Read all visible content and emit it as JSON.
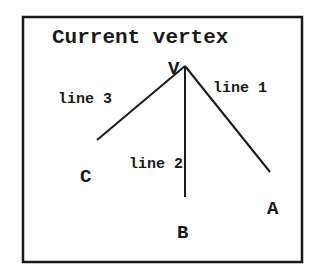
{
  "diagram": {
    "title": "Current vertex",
    "vertex_label": "V",
    "lines": [
      {
        "label": "line 1",
        "end_label": "A"
      },
      {
        "label": "line 2",
        "end_label": "B"
      },
      {
        "label": "line 3",
        "end_label": "C"
      }
    ]
  }
}
